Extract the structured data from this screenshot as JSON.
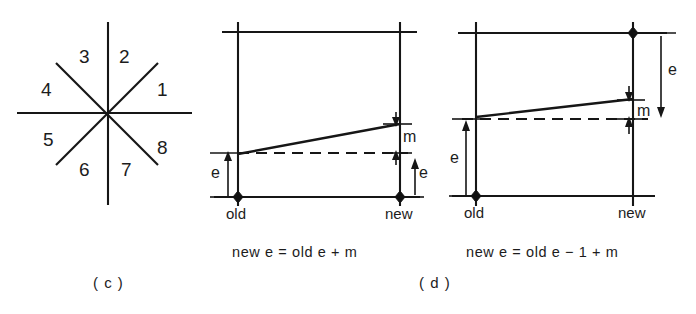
{
  "figure": {
    "background_color": "#ffffff",
    "ink_color": "#161616"
  },
  "panel_c": {
    "label": "( c )",
    "caption_name": "panel-c-label",
    "description": "eight-octant star",
    "octants": [
      {
        "id": 1,
        "label": "1",
        "x": 157,
        "y": 80
      },
      {
        "id": 2,
        "label": "2",
        "x": 119,
        "y": 47
      },
      {
        "id": 3,
        "label": "3",
        "x": 79,
        "y": 47
      },
      {
        "id": 4,
        "label": "4",
        "x": 41,
        "y": 80
      },
      {
        "id": 5,
        "label": "5",
        "x": 43,
        "y": 130
      },
      {
        "id": 6,
        "label": "6",
        "x": 79,
        "y": 160
      },
      {
        "id": 7,
        "label": "7",
        "x": 121,
        "y": 160
      },
      {
        "id": 8,
        "label": "8",
        "x": 157,
        "y": 138
      }
    ],
    "center": {
      "x": 108,
      "y": 113
    },
    "rays": {
      "vertical_top_y": 22,
      "vertical_bottom_y": 205,
      "horizontal_left_x": 17,
      "horizontal_right_x": 192,
      "diagonal_half_length": 70
    }
  },
  "panel_d": {
    "label": "( d )",
    "caption_name": "panel-d-label",
    "left_diagram": {
      "equation": "new e = old e + m",
      "x_axis_labels": {
        "old": "old",
        "new": "new"
      },
      "e_label_left": "e",
      "e_label_right": "e",
      "m_label": "m",
      "geometry": {
        "left_x": 238,
        "right_x": 400,
        "top_y": 32,
        "bottom_y": 197,
        "line_start_y": 154,
        "line_end_y": 124,
        "dashed_y": 153
      }
    },
    "right_diagram": {
      "equation": "new e = old e − 1 + m",
      "x_axis_labels": {
        "old": "old",
        "new": "new"
      },
      "e_label_left": "e",
      "e_label_right": "e",
      "m_label": "m",
      "geometry": {
        "left_x": 476,
        "right_x": 633,
        "top_y": 33,
        "bottom_y": 196,
        "line_start_y": 117,
        "line_end_y": 99,
        "dashed_y": 119
      }
    }
  }
}
